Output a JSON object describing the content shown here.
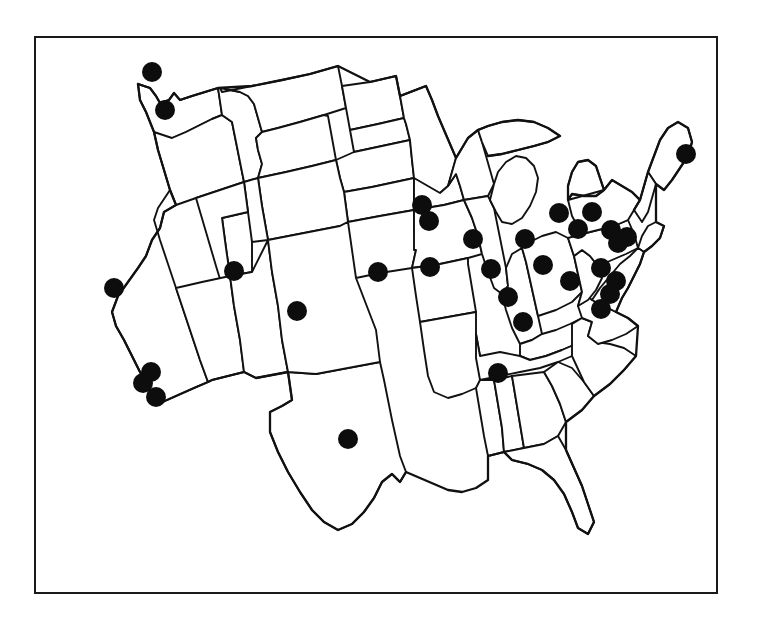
{
  "figure": {
    "title": "Map of the contiguous United States with filled circle markers at selected metropolitan locations",
    "description": "Black-and-white line map of the 48 contiguous United States drawn with hand-inked state boundaries, enclosed in a thin rectangular border. Solid black dots mark city locations.",
    "marker_label": "location-marker",
    "border_color": "#1a1a1a",
    "line_color": "#111111",
    "marker_color": "#0d0d0d",
    "background_color": "#ffffff",
    "marker_count": "32"
  },
  "frame": {
    "x": 34,
    "y": 36,
    "width": 684,
    "height": 558,
    "stroke_width": 2
  },
  "chart_data": {
    "type": "scatter",
    "title": "Map of the contiguous United States with filled circle markers at selected metropolitan locations",
    "xlabel": "",
    "ylabel": "",
    "xlim": [
      34,
      718
    ],
    "ylim": [
      36,
      594
    ],
    "grid": false,
    "legend": "none",
    "marker_shape": "filled-circle",
    "marker_radius": 9.5,
    "series": [
      {
        "name": "location-markers",
        "points": [
          {
            "label": "Seattle WA",
            "x": 152,
            "y": 72,
            "r": 10
          },
          {
            "label": "Portland OR",
            "x": 165,
            "y": 110,
            "r": 10
          },
          {
            "label": "San Francisco CA",
            "x": 114,
            "y": 288,
            "r": 10
          },
          {
            "label": "Los Angeles CA",
            "x": 151,
            "y": 372,
            "r": 10
          },
          {
            "label": "Los Angeles CA (2)",
            "x": 143,
            "y": 383,
            "r": 10
          },
          {
            "label": "San Diego CA",
            "x": 156,
            "y": 397,
            "r": 10
          },
          {
            "label": "Salt Lake City UT",
            "x": 234,
            "y": 271,
            "r": 10
          },
          {
            "label": "Denver CO",
            "x": 297,
            "y": 311,
            "r": 10
          },
          {
            "label": "Omaha NE",
            "x": 378,
            "y": 272,
            "r": 10
          },
          {
            "label": "Dallas TX",
            "x": 348,
            "y": 439,
            "r": 10
          },
          {
            "label": "Minneapolis MN",
            "x": 422,
            "y": 205,
            "r": 10
          },
          {
            "label": "St Paul MN",
            "x": 429,
            "y": 221,
            "r": 10
          },
          {
            "label": "Des Moines IA",
            "x": 430,
            "y": 267,
            "r": 10
          },
          {
            "label": "Madison WI",
            "x": 473,
            "y": 239,
            "r": 10
          },
          {
            "label": "Chicago IL",
            "x": 491,
            "y": 269,
            "r": 10
          },
          {
            "label": "Detroit MI",
            "x": 525,
            "y": 239,
            "r": 10
          },
          {
            "label": "Sault area MI",
            "x": 559,
            "y": 213,
            "r": 10
          },
          {
            "label": "St Louis MO",
            "x": 508,
            "y": 297,
            "r": 10
          },
          {
            "label": "Indianapolis IN",
            "x": 523,
            "y": 322,
            "r": 10
          },
          {
            "label": "Cleveland OH",
            "x": 543,
            "y": 265,
            "r": 10
          },
          {
            "label": "Columbus OH",
            "x": 570,
            "y": 281,
            "r": 10
          },
          {
            "label": "Nashville TN",
            "x": 498,
            "y": 373,
            "r": 10
          },
          {
            "label": "Buffalo NY",
            "x": 592,
            "y": 212,
            "r": 10
          },
          {
            "label": "Syracuse NY",
            "x": 611,
            "y": 230,
            "r": 10
          },
          {
            "label": "Albany NY",
            "x": 618,
            "y": 243,
            "r": 10
          },
          {
            "label": "Pittsburgh PA",
            "x": 601,
            "y": 268,
            "r": 10
          },
          {
            "label": "Philadelphia PA",
            "x": 616,
            "y": 281,
            "r": 10
          },
          {
            "label": "Baltimore MD",
            "x": 610,
            "y": 294,
            "r": 10
          },
          {
            "label": "Washington DC",
            "x": 601,
            "y": 309,
            "r": 10
          },
          {
            "label": "Boston MA",
            "x": 627,
            "y": 237,
            "r": 10
          },
          {
            "label": "Portland ME",
            "x": 686,
            "y": 154,
            "r": 10
          },
          {
            "label": "Richmond VA",
            "x": 578,
            "y": 229,
            "r": 10
          }
        ]
      }
    ]
  }
}
